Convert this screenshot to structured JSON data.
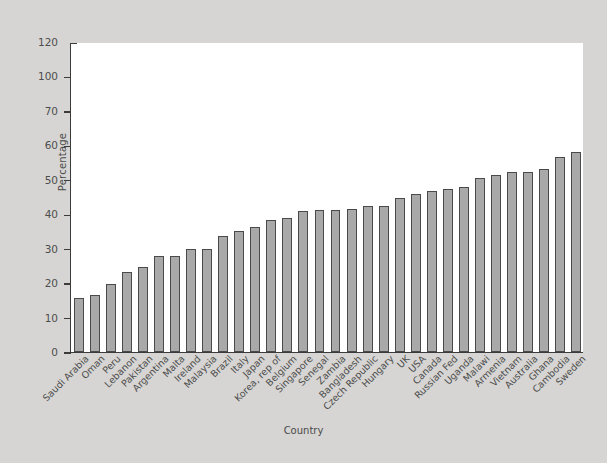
{
  "chart_data": {
    "type": "bar",
    "title": "",
    "xlabel": "Country",
    "ylabel": "Percentage",
    "ylim": [
      0,
      120
    ],
    "ytick_labels": [
      "120",
      "100",
      "70",
      "60",
      "50",
      "40",
      "30",
      "20",
      "10",
      "0"
    ],
    "ytick_values": [
      120,
      110,
      100,
      90,
      80,
      70,
      60,
      50,
      40,
      30,
      20,
      10,
      0
    ],
    "grid": false,
    "legend": null,
    "categories": [
      "Saudi Arabia",
      "Oman",
      "Peru",
      "Lebanon",
      "Pakistan",
      "Argentina",
      "Malta",
      "Ireland",
      "Malaysia",
      "Brazil",
      "Italy",
      "Japan",
      "Korea, rep of",
      "Belgium",
      "Singapore",
      "Senegal",
      "Zambia",
      "Bangladesh",
      "Czech Republic",
      "Hungary",
      "UK",
      "USA",
      "Canada",
      "Russian Fed",
      "Uganda",
      "Malawi",
      "Armenia",
      "Vietnam",
      "Australia",
      "Ghana",
      "Cambodia",
      "Sweden"
    ],
    "values": [
      21,
      22,
      26.5,
      31,
      33,
      37,
      37,
      40,
      40,
      45,
      47,
      48.5,
      51,
      52,
      54.5,
      55,
      55,
      55.5,
      56.5,
      56.5,
      59.5,
      61,
      62.5,
      63,
      64,
      67.5,
      68.5,
      69.5,
      69.5,
      71,
      75.5,
      77.5
    ]
  },
  "style": {
    "bar_fill": "#a9a9a9",
    "bar_edge": "#4a4a4a",
    "panel_background": "#ffffff",
    "figure_background": "#d6d5d3",
    "axis_color": "#3b3b3b",
    "text_color": "#4d4d4d"
  }
}
